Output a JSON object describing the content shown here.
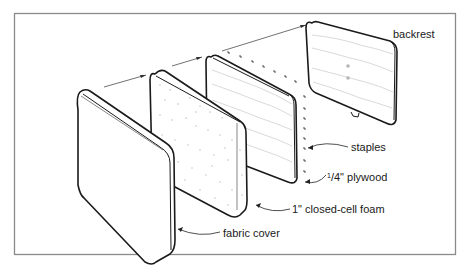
{
  "diagram": {
    "type": "exploded-assembly",
    "parts": [
      {
        "id": "fabric-cover",
        "label": "fabric cover"
      },
      {
        "id": "foam",
        "label": "1\" closed-cell foam"
      },
      {
        "id": "plywood",
        "label": "¼\" plywood",
        "label_sup": "1",
        "label_sub": "/4\" plywood"
      },
      {
        "id": "staples",
        "label": "staples"
      },
      {
        "id": "backrest",
        "label": "backrest"
      }
    ],
    "colors": {
      "line": "#1a1a1a",
      "frame": "#8a8a8a",
      "background": "#ffffff"
    }
  }
}
